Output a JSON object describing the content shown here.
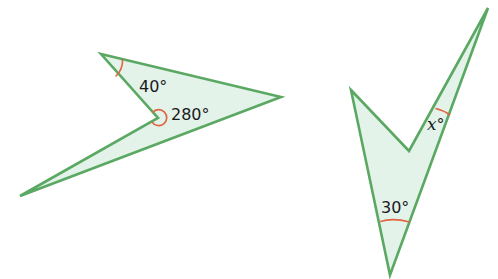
{
  "colors": {
    "outline": "#5aa862",
    "fill": "#e3f3ea",
    "angle_arc": "#e0643f",
    "text": "#1a1a1a"
  },
  "shapes": [
    {
      "name": "left-arrowhead-quadrilateral",
      "vertices": [
        [
          101,
          54
        ],
        [
          281,
          97
        ],
        [
          20,
          196
        ],
        [
          158,
          118
        ]
      ],
      "angles": [
        {
          "label": "40°",
          "vertex": "top-left"
        },
        {
          "label": "280°",
          "vertex": "reflex"
        }
      ]
    },
    {
      "name": "right-dart-quadrilateral",
      "vertices": [
        [
          351,
          90
        ],
        [
          409,
          151
        ],
        [
          488,
          8
        ],
        [
          390,
          275
        ]
      ],
      "angles": [
        {
          "label": "x°",
          "vertex": "top-right",
          "variable": "x"
        },
        {
          "label": "30°",
          "vertex": "bottom"
        }
      ]
    }
  ],
  "labels": {
    "angle_40": "40°",
    "angle_280": "280°",
    "angle_x_var": "x",
    "angle_x_deg": "°",
    "angle_30": "30°"
  }
}
